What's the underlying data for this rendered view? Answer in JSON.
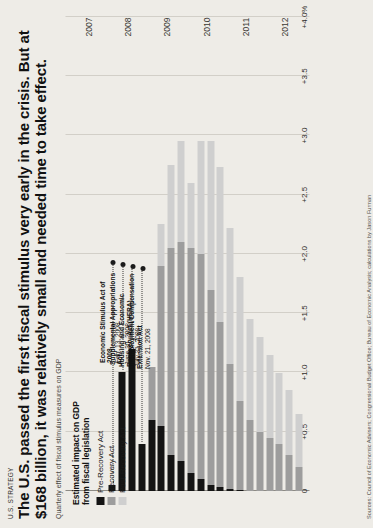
{
  "kicker": "U.S. STRATEGY",
  "headline": "The U.S. passed the first fiscal stimulus very early in the crisis. But at $168 billion, it was relatively small and needed time to take effect.",
  "subhead": "Quarterly effect of fiscal stimulus measures on GDP",
  "source": "Sources: Council of Economic Advisers; Congressional Budget Office; Bureau of Economic Analysis; calculations by Jason Furman",
  "legend": {
    "title": "Estimated impact on GDP from fiscal legislation",
    "items": [
      {
        "label": "Pre-Recovery Act",
        "color": "#141414"
      },
      {
        "label": "Recovery Act",
        "color": "#9d9d9d"
      },
      {
        "label": "Post-Recovery Act",
        "color": "#cfcfcf"
      }
    ]
  },
  "annotations": [
    {
      "name": "Unemployment Compensation Extension Act",
      "date": "Nov. 21, 2008"
    },
    {
      "name": "Housing and Economic Recovery Act (HERA)",
      "date": "July 31, 2008"
    },
    {
      "name": "Supplemental Appropriations Act",
      "date": "June 30, 2008"
    },
    {
      "name": "Economic Stimulus Act of 2008",
      "date": "Feb. 13, 2008"
    }
  ],
  "chart_data": {
    "type": "bar",
    "orientation": "horizontal-stacked",
    "title": "The U.S. passed the first fiscal stimulus very early in the crisis. But at $168 billion, it was relatively small and needed time to take effect.",
    "subtitle": "Quarterly effect of fiscal stimulus measures on GDP",
    "xlabel": "",
    "ylabel": "Estimated impact on GDP from fiscal legislation",
    "ylim": [
      0,
      4.0
    ],
    "ytick_labels": [
      "0",
      "+0.5",
      "+1.0",
      "+1.5",
      "+2.0",
      "+2.5",
      "+3.0",
      "+3.5",
      "+4.0%"
    ],
    "ytick_values": [
      0,
      0.5,
      1.0,
      1.5,
      2.0,
      2.5,
      3.0,
      3.5,
      4.0
    ],
    "xtick_labels": [
      "2007",
      "2008",
      "2009",
      "2010",
      "2011",
      "2012"
    ],
    "grid": true,
    "legend_position": "inside-top-left",
    "series": [
      {
        "name": "Pre-Recovery Act",
        "color": "#141414"
      },
      {
        "name": "Recovery Act",
        "color": "#9d9d9d"
      },
      {
        "name": "Post-Recovery Act",
        "color": "#cfcfcf"
      }
    ],
    "categories": [
      "2007 Q1",
      "2007 Q2",
      "2007 Q3",
      "2007 Q4",
      "2008 Q1",
      "2008 Q2",
      "2008 Q3",
      "2008 Q4",
      "2009 Q1",
      "2009 Q2",
      "2009 Q3",
      "2009 Q4",
      "2010 Q1",
      "2010 Q2",
      "2010 Q3",
      "2010 Q4",
      "2011 Q1",
      "2011 Q2",
      "2011 Q3",
      "2011 Q4",
      "2012 Q1",
      "2012 Q2",
      "2012 Q3",
      "2012 Q4"
    ],
    "values": {
      "Pre-Recovery Act": [
        0,
        0,
        0,
        0,
        0.05,
        1.0,
        1.2,
        0.4,
        0.6,
        0.55,
        0.3,
        0.25,
        0.15,
        0.1,
        0.05,
        0.03,
        0.02,
        0.01,
        0,
        0,
        0,
        0,
        0,
        0
      ],
      "Recovery Act": [
        0,
        0,
        0,
        0,
        0,
        0,
        0,
        0,
        0.45,
        1.35,
        1.75,
        1.85,
        1.9,
        1.9,
        1.65,
        1.4,
        1.05,
        0.75,
        0.6,
        0.5,
        0.45,
        0.4,
        0.3,
        0.2
      ],
      "Post-Recovery Act": [
        0,
        0,
        0,
        0,
        0,
        0,
        0,
        0,
        0,
        0.35,
        0.7,
        0.85,
        0.55,
        0.95,
        1.25,
        1.3,
        1.15,
        1.05,
        0.85,
        0.8,
        0.7,
        0.6,
        0.55,
        0.45
      ]
    },
    "totals": [
      0,
      0,
      0,
      0,
      0.05,
      1.0,
      1.2,
      0.4,
      1.05,
      2.25,
      2.75,
      2.95,
      2.6,
      2.95,
      2.95,
      2.73,
      2.22,
      1.81,
      1.45,
      1.3,
      1.15,
      1.0,
      0.85,
      0.65
    ]
  }
}
